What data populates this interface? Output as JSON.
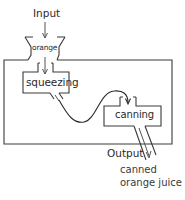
{
  "diagram": {
    "input_label": "Input",
    "input_material": "orange",
    "stages": [
      {
        "id": "squeezing",
        "label": "squeezing"
      },
      {
        "id": "canning",
        "label": "canning"
      }
    ],
    "output_label": "Output",
    "output_product_line1": "canned",
    "output_product_line2": "orange juice",
    "colors": {
      "stroke": "#3a3a3a",
      "text": "#2a2a2a",
      "background": "#ffffff"
    }
  }
}
